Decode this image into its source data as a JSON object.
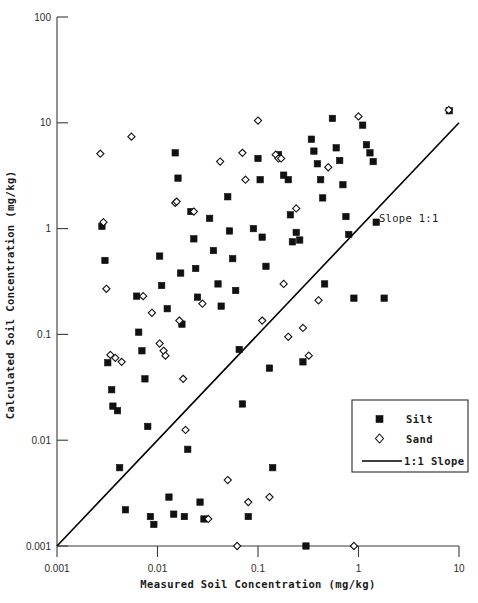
{
  "chart_data": {
    "type": "scatter",
    "title": "",
    "xlabel": "Measured Soil Concentration (mg/kg)",
    "ylabel": "Calculated Soil Concentration (mg/kg)",
    "xscale": "log",
    "yscale": "log",
    "xlim": [
      0.001,
      10
    ],
    "ylim": [
      0.001,
      100
    ],
    "xticks": [
      0.001,
      0.01,
      0.1,
      1,
      10
    ],
    "xtick_labels": [
      "0.001",
      "0.01",
      "0.1",
      "1",
      "10"
    ],
    "yticks": [
      0.001,
      0.01,
      0.1,
      1,
      10,
      100
    ],
    "ytick_labels": [
      "0.001",
      "0.01",
      "0.1",
      "1",
      "10",
      "100"
    ],
    "grid": false,
    "legend_position": "lower right",
    "annotations": [
      {
        "text": "Slope 1:1",
        "x": 1.6,
        "y": 1.15
      }
    ],
    "reference_line": {
      "name": "1:1 Slope",
      "from": [
        0.001,
        0.001
      ],
      "to": [
        10,
        10
      ]
    },
    "series": [
      {
        "name": "Silt",
        "marker": "filled-square",
        "color": "#111111",
        "points": [
          [
            0.0028,
            1.05
          ],
          [
            0.003,
            0.5
          ],
          [
            0.0032,
            0.054
          ],
          [
            0.0035,
            0.03
          ],
          [
            0.0036,
            0.021
          ],
          [
            0.004,
            0.019
          ],
          [
            0.0042,
            0.0055
          ],
          [
            0.0048,
            0.0022
          ],
          [
            0.0062,
            0.23
          ],
          [
            0.0065,
            0.105
          ],
          [
            0.007,
            0.07
          ],
          [
            0.0075,
            0.038
          ],
          [
            0.008,
            0.0135
          ],
          [
            0.0085,
            0.0019
          ],
          [
            0.0092,
            0.0016
          ],
          [
            0.0105,
            0.55
          ],
          [
            0.011,
            0.29
          ],
          [
            0.0125,
            0.175
          ],
          [
            0.013,
            0.0029
          ],
          [
            0.0145,
            0.002
          ],
          [
            0.015,
            5.2
          ],
          [
            0.016,
            3.0
          ],
          [
            0.017,
            0.38
          ],
          [
            0.0175,
            0.125
          ],
          [
            0.0185,
            0.0019
          ],
          [
            0.02,
            0.0082
          ],
          [
            0.0215,
            1.45
          ],
          [
            0.023,
            0.8
          ],
          [
            0.024,
            0.42
          ],
          [
            0.025,
            0.225
          ],
          [
            0.0265,
            0.0026
          ],
          [
            0.029,
            0.0018
          ],
          [
            0.033,
            1.25
          ],
          [
            0.036,
            0.62
          ],
          [
            0.04,
            0.3
          ],
          [
            0.043,
            0.185
          ],
          [
            0.05,
            2.0
          ],
          [
            0.052,
            0.95
          ],
          [
            0.056,
            0.52
          ],
          [
            0.06,
            0.26
          ],
          [
            0.065,
            0.072
          ],
          [
            0.07,
            0.022
          ],
          [
            0.08,
            0.0019
          ],
          [
            0.09,
            1.0
          ],
          [
            0.1,
            4.6
          ],
          [
            0.105,
            2.9
          ],
          [
            0.11,
            0.83
          ],
          [
            0.12,
            0.44
          ],
          [
            0.13,
            0.048
          ],
          [
            0.14,
            0.0055
          ],
          [
            0.16,
            5.0
          ],
          [
            0.18,
            3.2
          ],
          [
            0.2,
            2.9
          ],
          [
            0.21,
            1.35
          ],
          [
            0.22,
            0.75
          ],
          [
            0.24,
            0.92
          ],
          [
            0.26,
            0.78
          ],
          [
            0.28,
            0.055
          ],
          [
            0.3,
            0.001
          ],
          [
            0.34,
            7.0
          ],
          [
            0.36,
            5.4
          ],
          [
            0.39,
            4.1
          ],
          [
            0.42,
            2.9
          ],
          [
            0.44,
            1.95
          ],
          [
            0.46,
            0.3
          ],
          [
            0.55,
            11.0
          ],
          [
            0.6,
            5.8
          ],
          [
            0.65,
            4.4
          ],
          [
            0.7,
            2.6
          ],
          [
            0.75,
            1.3
          ],
          [
            0.8,
            0.88
          ],
          [
            0.9,
            0.22
          ],
          [
            1.1,
            9.5
          ],
          [
            1.2,
            6.2
          ],
          [
            1.3,
            5.2
          ],
          [
            1.4,
            4.3
          ],
          [
            1.5,
            1.15
          ],
          [
            1.8,
            0.22
          ],
          [
            8.0,
            13.0
          ]
        ]
      },
      {
        "name": "Sand",
        "marker": "open-diamond",
        "color": "#ffffff",
        "points": [
          [
            0.0027,
            5.1
          ],
          [
            0.0029,
            1.15
          ],
          [
            0.0031,
            0.27
          ],
          [
            0.0034,
            0.064
          ],
          [
            0.0038,
            0.06
          ],
          [
            0.0044,
            0.055
          ],
          [
            0.0055,
            7.4
          ],
          [
            0.0072,
            0.23
          ],
          [
            0.0088,
            0.16
          ],
          [
            0.0105,
            0.082
          ],
          [
            0.0115,
            0.07
          ],
          [
            0.012,
            0.063
          ],
          [
            0.015,
            1.75
          ],
          [
            0.0155,
            1.8
          ],
          [
            0.0165,
            0.135
          ],
          [
            0.018,
            0.038
          ],
          [
            0.019,
            0.0125
          ],
          [
            0.023,
            1.45
          ],
          [
            0.028,
            0.195
          ],
          [
            0.032,
            0.0018
          ],
          [
            0.042,
            4.3
          ],
          [
            0.05,
            0.0042
          ],
          [
            0.062,
            0.001
          ],
          [
            0.07,
            5.2
          ],
          [
            0.075,
            2.9
          ],
          [
            0.08,
            0.0026
          ],
          [
            0.1,
            10.5
          ],
          [
            0.11,
            0.135
          ],
          [
            0.13,
            0.0029
          ],
          [
            0.15,
            5.0
          ],
          [
            0.16,
            4.6
          ],
          [
            0.17,
            4.6
          ],
          [
            0.18,
            0.3
          ],
          [
            0.2,
            0.095
          ],
          [
            0.24,
            1.55
          ],
          [
            0.28,
            0.115
          ],
          [
            0.32,
            0.063
          ],
          [
            0.4,
            0.21
          ],
          [
            0.5,
            3.8
          ],
          [
            0.9,
            0.001
          ],
          [
            1.0,
            11.5
          ],
          [
            7.9,
            13.2
          ]
        ]
      }
    ]
  },
  "axes": {
    "x_title": "Measured Soil Concentration (mg/kg)",
    "y_title": "Calculated Soil Concentration (mg/kg)"
  },
  "legend": {
    "entries": [
      {
        "label": "Silt",
        "marker": "filled-square"
      },
      {
        "label": "Sand",
        "marker": "open-diamond"
      },
      {
        "label": "1:1 Slope",
        "marker": "line"
      }
    ]
  },
  "annotation": {
    "slope_label": "Slope 1:1"
  }
}
